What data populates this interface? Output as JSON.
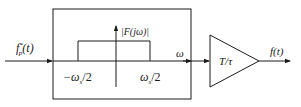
{
  "diagram": {
    "input_label_main": "f",
    "input_label_sub": "p",
    "input_label_sup": "*",
    "input_label_arg": "(t)",
    "spectrum_label": "|F(jω)|",
    "axis_label": "ω",
    "left_cut_prefix": "−ω",
    "left_cut_sub": "s",
    "left_cut_suffix": "/2",
    "right_cut_prefix": "ω",
    "right_cut_sub": "s",
    "right_cut_suffix": "/2",
    "gain_label": "T/τ",
    "output_label": "f(t)"
  },
  "colors": {
    "line": "#1a1a1a",
    "background": "#ffffff"
  }
}
